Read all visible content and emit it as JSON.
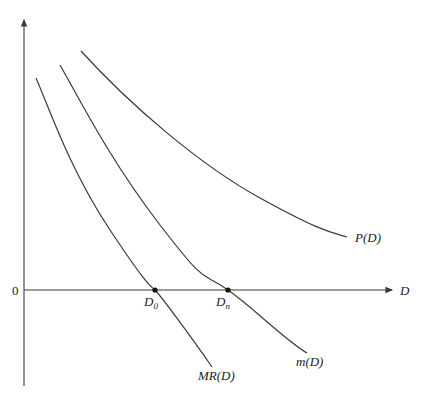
{
  "diagram": {
    "axes": {
      "x_label": "D",
      "origin_label": "0"
    },
    "curves": [
      {
        "id": "P",
        "label": "P(D)"
      },
      {
        "id": "m",
        "label": "m(D)"
      },
      {
        "id": "MR",
        "label": "MR(D)"
      }
    ],
    "points": [
      {
        "id": "D0",
        "base": "D",
        "sub": "0"
      },
      {
        "id": "Dn",
        "base": "D",
        "sub": "n"
      }
    ],
    "colors": {
      "line": "#3a3a3a",
      "text": "#222222"
    }
  }
}
